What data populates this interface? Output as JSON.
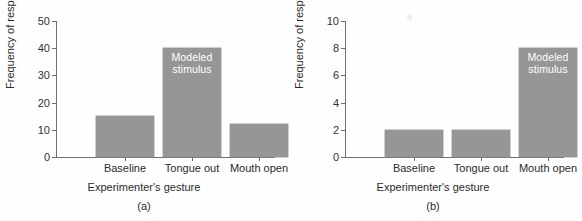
{
  "figure": {
    "background_color": "#fefefe",
    "bar_color": "#969696",
    "axis_color": "#6f6f6f",
    "note_text_color": "#ffffff"
  },
  "chart_data": [
    {
      "type": "bar",
      "panel_tag": "(a)",
      "title": "",
      "categories": [
        "Baseline",
        "Tongue out",
        "Mouth open"
      ],
      "values": [
        15,
        40,
        12
      ],
      "xlabel": "Experimenter's gesture",
      "ylabel": "Frequency of response",
      "ylim": [
        0,
        50
      ],
      "yticks": [
        0,
        10,
        20,
        30,
        40,
        50
      ],
      "ytick_labels": [
        "0",
        "10",
        "20",
        "30",
        "40",
        "50"
      ],
      "grid": false,
      "legend": "none",
      "annotations": [
        {
          "text": "Modeled stimulus",
          "lines": [
            "Modeled",
            "stimulus"
          ],
          "on_category": "Tongue out"
        }
      ]
    },
    {
      "type": "bar",
      "panel_tag": "(b)",
      "title": "",
      "categories": [
        "Baseline",
        "Tongue out",
        "Mouth open"
      ],
      "values": [
        2,
        2,
        8
      ],
      "xlabel": "Experimenter's gesture",
      "ylabel": "Frequency of response",
      "ylim": [
        0,
        10
      ],
      "yticks": [
        0,
        2,
        4,
        6,
        8,
        10
      ],
      "ytick_labels": [
        "0",
        "2",
        "4",
        "6",
        "8",
        "10"
      ],
      "grid": false,
      "legend": "none",
      "annotations": [
        {
          "text": "Modeled stimulus",
          "lines": [
            "Modeled",
            "stimulus"
          ],
          "on_category": "Mouth open"
        }
      ]
    }
  ]
}
